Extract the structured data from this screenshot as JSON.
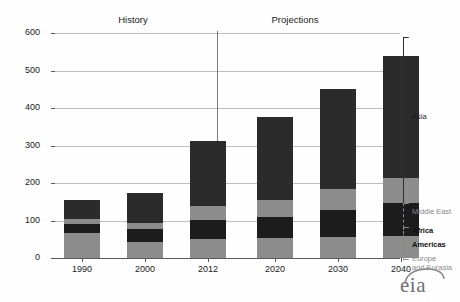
{
  "chart_data": {
    "type": "bar",
    "subtype": "stacked-bar",
    "title": "",
    "xlabel": "",
    "ylabel": "",
    "ylim": [
      0,
      600
    ],
    "yticks": [
      0,
      100,
      200,
      300,
      400,
      500,
      600
    ],
    "grid": true,
    "legend_position": "right",
    "categories": [
      "1990",
      "2000",
      "2012",
      "2020",
      "2030",
      "2040"
    ],
    "series": [
      {
        "name": "Europe and Eurasia",
        "color": "#8c8c8c",
        "values": [
          67,
          42,
          50,
          53,
          57,
          60
        ]
      },
      {
        "name": "Americas",
        "color": "#1c1c1c",
        "values": [
          23,
          35,
          52,
          57,
          72,
          86
        ]
      },
      {
        "name": "Africa",
        "color": "#8c8c8c",
        "values": [
          8,
          7,
          8,
          7,
          9,
          10
        ]
      },
      {
        "name": "Middle East",
        "color": "#8c8c8c",
        "values": [
          5,
          10,
          28,
          37,
          45,
          57
        ]
      },
      {
        "name": "Asia",
        "color": "#2b2b2b",
        "values": [
          52,
          80,
          174,
          223,
          269,
          325
        ]
      }
    ],
    "totals": [
      155,
      174,
      312,
      377,
      452,
      538
    ],
    "annotations": [
      {
        "name": "history",
        "label": "History",
        "span": [
          "1990",
          "2012"
        ]
      },
      {
        "name": "projections",
        "label": "Projections",
        "span": [
          "2020",
          "2040"
        ]
      }
    ],
    "divider": {
      "label": "",
      "between": [
        "2012",
        "2020"
      ]
    }
  },
  "axis": {
    "y_ticks": [
      "600",
      "500",
      "400",
      "300",
      "200",
      "100",
      "0"
    ],
    "x_ticks": [
      "1990",
      "2000",
      "2012",
      "2020",
      "2030",
      "2040"
    ]
  },
  "periods": {
    "history": "History",
    "projections": "Projections"
  },
  "legend": {
    "items": [
      {
        "label": "Asia",
        "style": "plain"
      },
      {
        "label": "Middle East",
        "style": "dim"
      },
      {
        "label": "Africa",
        "style": "bold"
      },
      {
        "label": "Americas",
        "style": "bold"
      },
      {
        "label": "Europe\nand Eurasia",
        "style": "dim"
      }
    ],
    "asia": "Asia",
    "middle_east": "Middle East",
    "africa": "Africa",
    "americas": "Americas",
    "europe_line1": "Europe",
    "europe_line2": "and Eurasia"
  },
  "branding": {
    "logo_text": "eia"
  },
  "colors": {
    "light_gray": "#8c8c8c",
    "dark": "#1c1c1c",
    "asia": "#2b2b2b",
    "grid": "#bdbdbd",
    "axis": "#5a5a5a"
  }
}
